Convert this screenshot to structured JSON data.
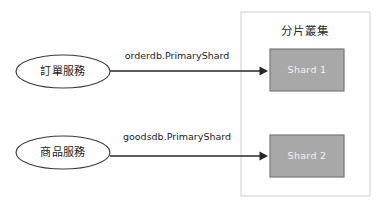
{
  "diagram": {
    "canvas": {
      "width": 379,
      "height": 204,
      "background": "#ffffff"
    },
    "services": [
      {
        "id": "order-service",
        "label": "訂單服務",
        "cx": 63,
        "cy": 71.5,
        "rx": 47,
        "ry": 16.5
      },
      {
        "id": "goods-service",
        "label": "商品服務",
        "cx": 63,
        "cy": 152.5,
        "rx": 47,
        "ry": 16.5
      }
    ],
    "edges": [
      {
        "id": "order-edge",
        "label": "orderdb.PrimaryShard",
        "from": "order-service",
        "to": "shard-1",
        "x1": 110,
        "x2": 268,
        "y": 71,
        "label_x": 177,
        "label_y": 56
      },
      {
        "id": "goods-edge",
        "label": "goodsdb.PrimaryShard",
        "from": "goods-service",
        "to": "shard-2",
        "x1": 110,
        "x2": 268,
        "y": 156,
        "label_x": 177,
        "label_y": 137
      }
    ],
    "cluster": {
      "id": "shard-cluster",
      "title": "分片叢集",
      "title_x": 305,
      "title_y": 31,
      "x": 241,
      "y": 12,
      "width": 129,
      "height": 184,
      "border_color": "#cfcfcf",
      "fill_color": "#ffffff",
      "shards": [
        {
          "id": "shard-1",
          "label": "Shard 1",
          "x": 270,
          "y": 49,
          "width": 74,
          "height": 42,
          "fill": "#a8a8a8",
          "stroke": "#787878",
          "text_color": "#f2f2f2"
        },
        {
          "id": "shard-2",
          "label": "Shard 2",
          "x": 270,
          "y": 135,
          "width": 74,
          "height": 42,
          "fill": "#a8a8a8",
          "stroke": "#787878",
          "text_color": "#f2f2f2"
        }
      ]
    }
  }
}
